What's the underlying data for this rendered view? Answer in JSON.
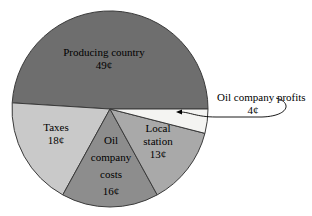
{
  "chart_data": {
    "type": "pie",
    "title": "",
    "subtitle": "",
    "xlabel": "",
    "ylabel": "",
    "unit": "¢",
    "total": 100,
    "legend_position": "none",
    "grid": false,
    "categories": [
      "Producing country",
      "Oil company profits",
      "Local station",
      "Oil company costs",
      "Taxes"
    ],
    "values": [
      49,
      4,
      13,
      16,
      18
    ],
    "slices": [
      {
        "name": "producing-country",
        "label": "Producing country",
        "value_label": "49¢",
        "value": 49,
        "color": "#6e6e6e",
        "label_placement": "inside",
        "label_x": 104,
        "label_y": 53,
        "value_x": 104,
        "value_y": 66
      },
      {
        "name": "oil-company-profits",
        "label": "Oil company profits",
        "value_label": "4¢",
        "value": 4,
        "color": "#f4f4f2",
        "label_placement": "callout",
        "label_x": 217,
        "label_y": 101,
        "value_x": 253,
        "value_y": 114
      },
      {
        "name": "local-station",
        "label": "Local station",
        "value_label": "13¢",
        "value": 13,
        "color": "#a9a9a9",
        "label_placement": "inside",
        "label_x": 158,
        "label_y": 129,
        "value_x": 158,
        "value_y": 154
      },
      {
        "name": "oil-company-costs",
        "label": "Oil company costs",
        "value_label": "16¢",
        "value": 16,
        "color": "#8d8d8d",
        "label_placement": "inside",
        "label_x": 111,
        "label_y": 141,
        "value_x": 111,
        "value_y": 192
      },
      {
        "name": "taxes",
        "label": "Taxes",
        "value_label": "18¢",
        "value": 18,
        "color": "#c9c9c9",
        "label_placement": "inside",
        "label_x": 56,
        "label_y": 128,
        "value_x": 56,
        "value_y": 141
      }
    ],
    "annotations": [
      {
        "name": "profits-callout",
        "text": "Oil company profits",
        "value_text": "4¢",
        "points_to": "oil-company-profits"
      }
    ],
    "geometry": {
      "center_x": 110,
      "center_y": 109,
      "radius": 98,
      "start_angle_deg": 0,
      "direction": "clockwise"
    },
    "colors": {
      "background": "#ffffff",
      "outline": "#3a3a3a",
      "text": "#000000"
    }
  },
  "slice_label_lines": {
    "producing_country": [
      "Producing country"
    ],
    "local_station": [
      "Local",
      "station"
    ],
    "oil_company_costs": [
      "Oil",
      "company",
      "costs"
    ],
    "taxes": [
      "Taxes"
    ]
  }
}
